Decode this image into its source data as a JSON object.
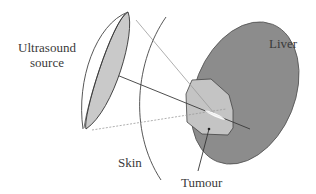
{
  "diagram": {
    "labels": {
      "source_line1": "Ultrasound",
      "source_line2": "source",
      "liver": "Liver",
      "skin": "Skin",
      "tumour": "Tumour"
    },
    "colors": {
      "liver_fill": "#8c8c8c",
      "tumour_fill": "#c4c4c4",
      "lens_fill": "#c9c9c9",
      "stroke": "#3a3a3a",
      "beam": "#9a9a9a"
    }
  }
}
